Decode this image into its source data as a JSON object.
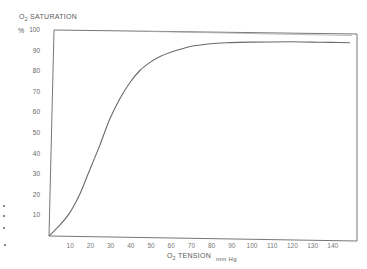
{
  "chart_data": {
    "type": "line",
    "title": "",
    "ylabel": "O2 SATURATION",
    "ylabel_unit": "%",
    "xlabel": "O2 TENSION",
    "xlabel_unit": "mm Hg",
    "xlim": [
      0,
      145
    ],
    "ylim": [
      0,
      100
    ],
    "x_ticks": [
      "10",
      "20",
      "30",
      "40",
      "50",
      "60",
      "70",
      "80",
      "90",
      "100",
      "110",
      "120",
      "130",
      "140"
    ],
    "y_ticks": [
      "100",
      "90",
      "80",
      "70",
      "60",
      "50",
      "40",
      "30",
      "20",
      "10"
    ],
    "grid": false,
    "legend": null,
    "series": [
      {
        "name": "Oxyhemoglobin dissociation curve",
        "x": [
          0,
          5,
          10,
          15,
          20,
          25,
          30,
          35,
          40,
          45,
          50,
          55,
          60,
          70,
          80,
          90,
          100,
          110,
          120,
          130,
          140,
          149
        ],
        "y": [
          0,
          5,
          11,
          20,
          32,
          44,
          57,
          67,
          75,
          81,
          85,
          88,
          90,
          93,
          94.5,
          95.2,
          95.6,
          95.8,
          96,
          96,
          96,
          96
        ]
      }
    ]
  },
  "labels": {
    "y_title_prefix": "O",
    "y_title_sub": "2",
    "y_title_rest": " SATURATION",
    "y_unit": "%",
    "x_title_prefix": "O",
    "x_title_sub": "2",
    "x_title_rest": "  TENSION",
    "x_unit": "mm Hg"
  }
}
